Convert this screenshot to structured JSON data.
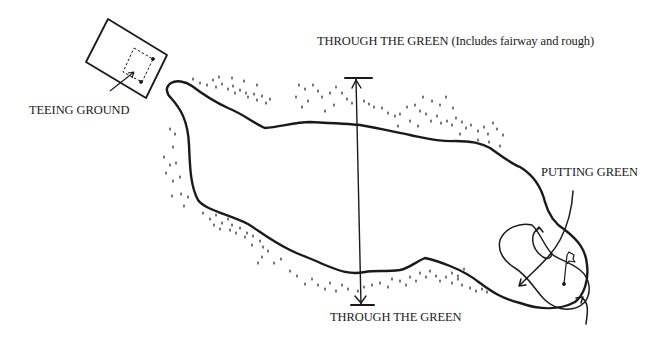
{
  "diagram": {
    "type": "golf-hole-layout",
    "colors": {
      "ink": "#1a1a1a",
      "background": "#ffffff"
    },
    "labels": {
      "teeing_ground": "TEEING GROUND",
      "through_the_green_top": "THROUGH THE GREEN (Includes fairway and rough)",
      "putting_green": "PUTTING GREEN",
      "through_the_green_bottom": "THROUGH THE GREEN"
    },
    "elements": [
      {
        "name": "teeing-ground-box",
        "description": "rectangle with dashed inner tee area"
      },
      {
        "name": "fairway-outline",
        "description": "elongated fairway shape from tee to green"
      },
      {
        "name": "rough-stipple",
        "description": "dotted rough areas along fairway edges"
      },
      {
        "name": "through-the-green-arrow",
        "description": "vertical double-headed arrow spanning the fairway"
      },
      {
        "name": "putting-green",
        "description": "oval green with flag and curved arrows"
      },
      {
        "name": "flag-icon",
        "description": "pin flag on putting green"
      }
    ]
  }
}
